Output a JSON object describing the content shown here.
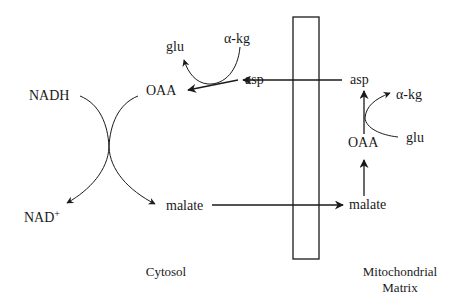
{
  "diagram": {
    "regions": {
      "cytosol": "Cytosol",
      "matrix_line1": "Mitochondrial",
      "matrix_line2": "Matrix"
    },
    "cytosol": {
      "nadh": "NADH",
      "nad_base": "NAD",
      "nad_sup": "+",
      "oaa": "OAA",
      "malate": "malate",
      "asp": "asp",
      "glu": "glu",
      "akg": "α-kg"
    },
    "matrix": {
      "asp": "asp",
      "akg": "α-kg",
      "glu": "glu",
      "oaa": "OAA",
      "malate": "malate"
    },
    "membrane": {
      "x": 293,
      "y": 17,
      "width": 26,
      "height": 242
    },
    "colors": {
      "stroke": "#1a1a1a",
      "background": "#ffffff"
    }
  }
}
